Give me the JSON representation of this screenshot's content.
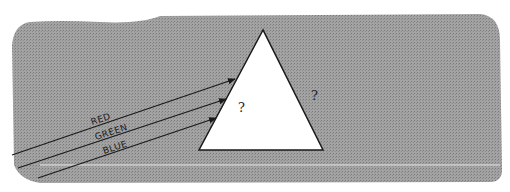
{
  "diagram": {
    "type": "prism-light-refraction-sketch",
    "background_color": "#9a9a9a",
    "triangle_fill": "#ffffff",
    "rays": [
      {
        "label": "RED"
      },
      {
        "label": "GREEN"
      },
      {
        "label": "BLUE"
      }
    ],
    "inside_prism_mark": "?",
    "outside_prism_mark": "?"
  }
}
